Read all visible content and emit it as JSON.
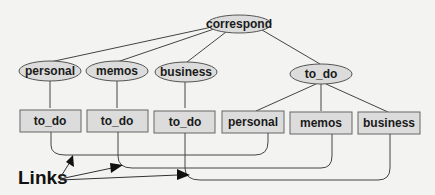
{
  "diagram": {
    "type": "tree-with-links",
    "root": {
      "label": "correspond",
      "shape": "ellipse"
    },
    "level1": [
      {
        "label": "personal",
        "shape": "ellipse"
      },
      {
        "label": "memos",
        "shape": "ellipse"
      },
      {
        "label": "business",
        "shape": "ellipse"
      },
      {
        "label": "to_do",
        "shape": "ellipse"
      }
    ],
    "level2": [
      {
        "label": "to_do",
        "shape": "box",
        "parent": "personal",
        "kind": "link"
      },
      {
        "label": "to_do",
        "shape": "box",
        "parent": "memos",
        "kind": "link"
      },
      {
        "label": "to_do",
        "shape": "box",
        "parent": "business",
        "kind": "link"
      },
      {
        "label": "personal",
        "shape": "box",
        "parent": "to_do",
        "kind": "link"
      },
      {
        "label": "memos",
        "shape": "box",
        "parent": "to_do",
        "kind": "link"
      },
      {
        "label": "business",
        "shape": "box",
        "parent": "to_do",
        "kind": "link"
      }
    ],
    "links_label": "Links",
    "colors": {
      "node_fill": "#dcdcdc",
      "stroke": "#555555",
      "background": "#f3f3f1"
    }
  }
}
